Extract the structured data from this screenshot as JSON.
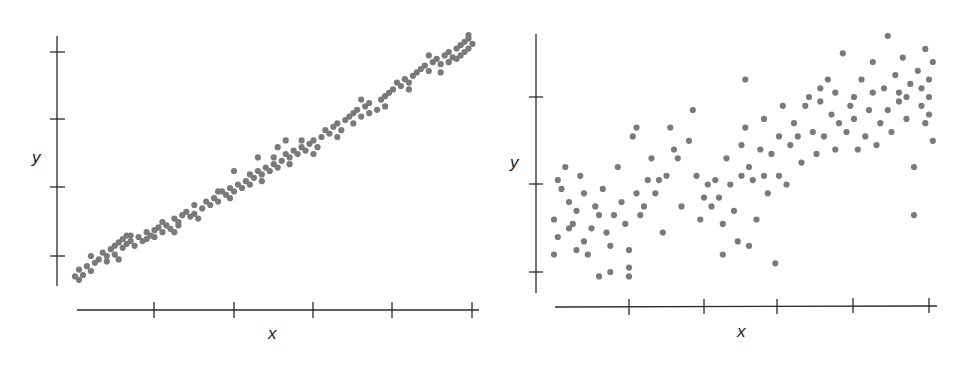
{
  "chart_data": [
    {
      "type": "scatter",
      "title": "",
      "xlabel": "x",
      "ylabel": "y",
      "x_ticks": [
        1,
        2,
        3,
        4,
        5
      ],
      "y_ticks": [
        1,
        2,
        3,
        4
      ],
      "tick_labels_shown": false,
      "xlim": [
        0,
        5
      ],
      "ylim": [
        0.5,
        4.3
      ],
      "grid": false,
      "point_color": "#7a7a7a",
      "description": "Strong positive linear relationship, tightly clustered",
      "points": [
        [
          0.0,
          0.7
        ],
        [
          0.05,
          0.65
        ],
        [
          0.05,
          0.8
        ],
        [
          0.1,
          0.72
        ],
        [
          0.15,
          0.85
        ],
        [
          0.2,
          0.78
        ],
        [
          0.25,
          0.9
        ],
        [
          0.2,
          1.0
        ],
        [
          0.3,
          0.95
        ],
        [
          0.35,
          1.05
        ],
        [
          0.4,
          1.0
        ],
        [
          0.4,
          0.92
        ],
        [
          0.45,
          1.1
        ],
        [
          0.5,
          1.15
        ],
        [
          0.5,
          1.02
        ],
        [
          0.55,
          1.2
        ],
        [
          0.6,
          1.12
        ],
        [
          0.6,
          1.25
        ],
        [
          0.65,
          1.18
        ],
        [
          0.7,
          1.22
        ],
        [
          0.7,
          1.3
        ],
        [
          0.75,
          1.15
        ],
        [
          0.8,
          1.28
        ],
        [
          0.85,
          1.22
        ],
        [
          0.9,
          1.35
        ],
        [
          0.9,
          1.25
        ],
        [
          0.95,
          1.3
        ],
        [
          1.0,
          1.38
        ],
        [
          1.0,
          1.28
        ],
        [
          1.05,
          1.42
        ],
        [
          1.1,
          1.35
        ],
        [
          1.1,
          1.5
        ],
        [
          1.15,
          1.45
        ],
        [
          1.2,
          1.4
        ],
        [
          1.25,
          1.55
        ],
        [
          1.3,
          1.5
        ],
        [
          1.35,
          1.6
        ],
        [
          1.3,
          1.45
        ],
        [
          1.4,
          1.65
        ],
        [
          1.45,
          1.58
        ],
        [
          1.5,
          1.62
        ],
        [
          1.5,
          1.75
        ],
        [
          1.6,
          1.7
        ],
        [
          1.65,
          1.8
        ],
        [
          1.7,
          1.75
        ],
        [
          1.75,
          1.85
        ],
        [
          1.8,
          1.8
        ],
        [
          1.85,
          1.95
        ],
        [
          1.9,
          1.9
        ],
        [
          1.95,
          2.0
        ],
        [
          1.95,
          1.85
        ],
        [
          2.0,
          1.95
        ],
        [
          2.05,
          2.05
        ],
        [
          2.1,
          2.0
        ],
        [
          2.15,
          2.1
        ],
        [
          2.2,
          2.05
        ],
        [
          2.2,
          2.2
        ],
        [
          2.25,
          2.15
        ],
        [
          2.3,
          2.25
        ],
        [
          2.35,
          2.2
        ],
        [
          2.35,
          2.1
        ],
        [
          2.4,
          2.3
        ],
        [
          2.45,
          2.25
        ],
        [
          2.5,
          2.35
        ],
        [
          2.5,
          2.45
        ],
        [
          2.55,
          2.3
        ],
        [
          2.6,
          2.4
        ],
        [
          2.65,
          2.5
        ],
        [
          2.7,
          2.45
        ],
        [
          2.7,
          2.35
        ],
        [
          2.75,
          2.55
        ],
        [
          2.8,
          2.5
        ],
        [
          2.85,
          2.6
        ],
        [
          2.85,
          2.7
        ],
        [
          2.9,
          2.55
        ],
        [
          2.95,
          2.65
        ],
        [
          3.0,
          2.7
        ],
        [
          3.05,
          2.6
        ],
        [
          3.1,
          2.75
        ],
        [
          3.15,
          2.85
        ],
        [
          3.2,
          2.8
        ],
        [
          3.25,
          2.9
        ],
        [
          3.3,
          2.95
        ],
        [
          3.35,
          2.85
        ],
        [
          3.4,
          3.0
        ],
        [
          3.45,
          3.05
        ],
        [
          3.5,
          2.95
        ],
        [
          3.5,
          3.1
        ],
        [
          3.55,
          3.15
        ],
        [
          3.6,
          3.05
        ],
        [
          3.65,
          3.2
        ],
        [
          3.7,
          3.1
        ],
        [
          3.7,
          3.25
        ],
        [
          3.8,
          3.15
        ],
        [
          3.85,
          3.3
        ],
        [
          3.9,
          3.35
        ],
        [
          3.95,
          3.4
        ],
        [
          4.0,
          3.45
        ],
        [
          4.05,
          3.55
        ],
        [
          4.1,
          3.5
        ],
        [
          4.15,
          3.6
        ],
        [
          4.2,
          3.55
        ],
        [
          4.25,
          3.65
        ],
        [
          4.3,
          3.7
        ],
        [
          4.35,
          3.75
        ],
        [
          4.4,
          3.8
        ],
        [
          4.45,
          3.72
        ],
        [
          4.5,
          3.85
        ],
        [
          4.55,
          3.9
        ],
        [
          4.6,
          3.82
        ],
        [
          4.65,
          3.95
        ],
        [
          4.7,
          4.0
        ],
        [
          4.75,
          3.92
        ],
        [
          4.8,
          4.05
        ],
        [
          4.85,
          4.1
        ],
        [
          4.9,
          4.15
        ],
        [
          4.9,
          4.0
        ],
        [
          4.95,
          4.2
        ],
        [
          4.95,
          4.05
        ],
        [
          5.0,
          4.12
        ],
        [
          0.55,
          0.95
        ],
        [
          0.65,
          1.3
        ],
        [
          1.25,
          1.35
        ],
        [
          1.55,
          1.55
        ],
        [
          2.0,
          2.25
        ],
        [
          2.3,
          2.45
        ],
        [
          2.65,
          2.7
        ],
        [
          3.0,
          2.5
        ],
        [
          3.3,
          2.75
        ],
        [
          3.6,
          3.3
        ],
        [
          3.9,
          3.2
        ],
        [
          4.2,
          3.45
        ],
        [
          4.45,
          3.95
        ],
        [
          4.7,
          3.85
        ],
        [
          4.85,
          3.95
        ],
        [
          4.95,
          4.25
        ],
        [
          4.8,
          3.9
        ],
        [
          4.6,
          3.7
        ],
        [
          2.55,
          2.6
        ],
        [
          1.8,
          1.95
        ]
      ]
    },
    {
      "type": "scatter",
      "title": "",
      "xlabel": "x",
      "ylabel": "y",
      "x_ticks": [
        1,
        2,
        3,
        4,
        5
      ],
      "y_ticks": [
        1,
        2,
        3
      ],
      "tick_labels_shown": false,
      "xlim": [
        0,
        5.1
      ],
      "ylim": [
        0.8,
        3.8
      ],
      "grid": false,
      "point_color": "#7a7a7a",
      "description": "Weak-to-moderate positive relationship, widely scattered",
      "points": [
        [
          0.0,
          1.6
        ],
        [
          0.05,
          1.4
        ],
        [
          0.0,
          1.2
        ],
        [
          0.05,
          2.05
        ],
        [
          0.1,
          1.95
        ],
        [
          0.15,
          2.2
        ],
        [
          0.2,
          1.8
        ],
        [
          0.25,
          1.55
        ],
        [
          0.3,
          1.7
        ],
        [
          0.35,
          2.1
        ],
        [
          0.4,
          1.9
        ],
        [
          0.4,
          1.35
        ],
        [
          0.45,
          1.2
        ],
        [
          0.5,
          1.5
        ],
        [
          0.55,
          1.75
        ],
        [
          0.6,
          1.65
        ],
        [
          0.65,
          1.95
        ],
        [
          0.7,
          1.45
        ],
        [
          0.75,
          1.3
        ],
        [
          0.8,
          1.65
        ],
        [
          0.85,
          2.2
        ],
        [
          0.9,
          1.8
        ],
        [
          0.95,
          1.55
        ],
        [
          1.0,
          1.25
        ],
        [
          1.0,
          1.05
        ],
        [
          1.05,
          2.55
        ],
        [
          1.1,
          2.65
        ],
        [
          1.1,
          1.9
        ],
        [
          1.15,
          1.65
        ],
        [
          1.2,
          1.75
        ],
        [
          0.6,
          0.95
        ],
        [
          0.75,
          1.0
        ],
        [
          1.0,
          0.95
        ],
        [
          1.3,
          2.3
        ],
        [
          1.35,
          1.9
        ],
        [
          1.4,
          2.05
        ],
        [
          1.5,
          2.1
        ],
        [
          1.6,
          2.4
        ],
        [
          1.65,
          2.3
        ],
        [
          1.7,
          1.75
        ],
        [
          1.8,
          2.5
        ],
        [
          1.85,
          2.85
        ],
        [
          1.9,
          2.1
        ],
        [
          1.95,
          1.6
        ],
        [
          2.0,
          1.85
        ],
        [
          2.05,
          2.0
        ],
        [
          2.1,
          1.75
        ],
        [
          2.15,
          2.05
        ],
        [
          2.2,
          1.85
        ],
        [
          2.25,
          1.55
        ],
        [
          2.25,
          1.2
        ],
        [
          2.3,
          2.3
        ],
        [
          2.35,
          2.0
        ],
        [
          2.4,
          1.7
        ],
        [
          2.45,
          1.35
        ],
        [
          2.5,
          2.1
        ],
        [
          2.5,
          2.45
        ],
        [
          2.55,
          3.2
        ],
        [
          2.55,
          2.65
        ],
        [
          2.6,
          2.2
        ],
        [
          2.65,
          2.05
        ],
        [
          2.7,
          1.6
        ],
        [
          2.75,
          2.4
        ],
        [
          2.8,
          2.75
        ],
        [
          2.8,
          2.1
        ],
        [
          2.85,
          1.9
        ],
        [
          2.9,
          2.35
        ],
        [
          2.95,
          1.1
        ],
        [
          3.0,
          2.55
        ],
        [
          3.05,
          2.9
        ],
        [
          3.1,
          2.0
        ],
        [
          3.15,
          2.45
        ],
        [
          3.2,
          2.7
        ],
        [
          3.25,
          2.55
        ],
        [
          3.3,
          2.25
        ],
        [
          3.35,
          2.9
        ],
        [
          3.4,
          3.0
        ],
        [
          3.45,
          2.6
        ],
        [
          3.5,
          2.35
        ],
        [
          3.55,
          3.1
        ],
        [
          3.6,
          2.55
        ],
        [
          3.65,
          3.2
        ],
        [
          3.7,
          2.8
        ],
        [
          3.75,
          2.4
        ],
        [
          3.75,
          3.05
        ],
        [
          3.8,
          2.7
        ],
        [
          3.85,
          3.5
        ],
        [
          3.9,
          2.6
        ],
        [
          3.95,
          2.9
        ],
        [
          4.0,
          2.75
        ],
        [
          4.0,
          3.0
        ],
        [
          4.05,
          2.4
        ],
        [
          4.1,
          3.2
        ],
        [
          4.15,
          2.55
        ],
        [
          4.2,
          2.85
        ],
        [
          4.25,
          3.05
        ],
        [
          4.3,
          2.45
        ],
        [
          4.35,
          2.7
        ],
        [
          4.4,
          3.1
        ],
        [
          4.45,
          2.85
        ],
        [
          4.5,
          2.6
        ],
        [
          4.55,
          3.25
        ],
        [
          4.6,
          2.95
        ],
        [
          4.65,
          3.45
        ],
        [
          4.7,
          2.75
        ],
        [
          4.7,
          3.0
        ],
        [
          4.75,
          3.15
        ],
        [
          4.8,
          2.2
        ],
        [
          4.8,
          1.65
        ],
        [
          4.85,
          3.3
        ],
        [
          4.9,
          2.9
        ],
        [
          4.9,
          3.1
        ],
        [
          4.95,
          2.7
        ],
        [
          4.95,
          3.55
        ],
        [
          5.0,
          3.2
        ],
        [
          5.0,
          2.8
        ],
        [
          5.0,
          3.0
        ],
        [
          5.05,
          3.4
        ],
        [
          5.05,
          2.5
        ],
        [
          4.6,
          3.05
        ],
        [
          1.25,
          2.05
        ],
        [
          1.45,
          1.45
        ],
        [
          1.55,
          2.65
        ],
        [
          2.6,
          1.3
        ],
        [
          3.0,
          2.1
        ],
        [
          3.55,
          2.95
        ],
        [
          4.25,
          3.4
        ],
        [
          4.45,
          3.7
        ],
        [
          0.3,
          1.25
        ],
        [
          0.2,
          1.5
        ]
      ]
    }
  ]
}
